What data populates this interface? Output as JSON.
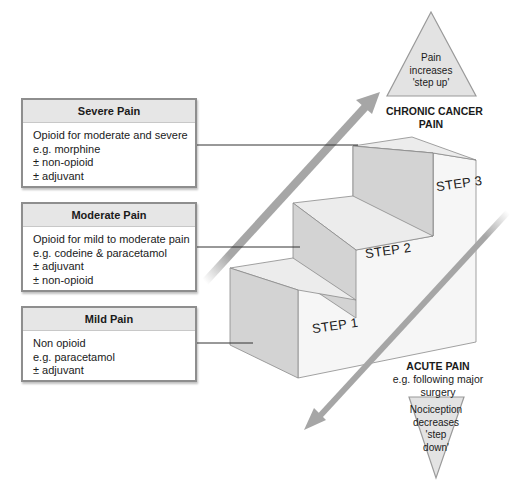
{
  "boxes": {
    "severe": {
      "title": "Severe Pain",
      "lines": [
        "Opioid for moderate and severe",
        "e.g. morphine",
        "± non-opioid",
        "± adjuvant"
      ]
    },
    "moderate": {
      "title": "Moderate Pain",
      "lines": [
        "Opioid for mild to moderate pain",
        "e.g. codeine & paracetamol",
        "± adjuvant",
        "± non-opioid"
      ]
    },
    "mild": {
      "title": "Mild Pain",
      "lines": [
        "Non opioid",
        "e.g. paracetamol",
        "± adjuvant"
      ]
    }
  },
  "steps": [
    "STEP 1",
    "STEP 2",
    "STEP 3"
  ],
  "top_triangle": {
    "lines": [
      "Pain",
      "increases",
      "'step up'"
    ]
  },
  "bottom_triangle": {
    "lines": [
      "Nociception",
      "decreases",
      "'step",
      "down'"
    ]
  },
  "chronic_label": {
    "line1": "CHRONIC CANCER",
    "line2": "PAIN"
  },
  "acute_label": {
    "title": "ACUTE PAIN",
    "line1": "e.g. following major",
    "line2": "surgery"
  },
  "colors": {
    "arrow": "#a6a6a6",
    "riser": "#d3d3d3",
    "tread": "#ececec",
    "front": "#f6f6f6",
    "box_border": "#8e8e8e",
    "box_header": "#e6e6e6",
    "triangle_fill": "#e3e3e3"
  }
}
